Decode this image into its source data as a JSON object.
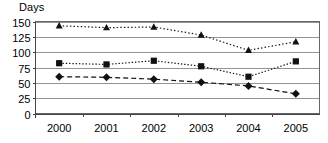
{
  "chart_data": {
    "type": "line",
    "title": "",
    "xlabel": "",
    "ylabel": "Days",
    "categories": [
      "2000",
      "2001",
      "2002",
      "2003",
      "2004",
      "2005"
    ],
    "ylim": [
      0,
      150
    ],
    "yticks": [
      0,
      25,
      50,
      75,
      100,
      125,
      150
    ],
    "ytick_labels": [
      "0",
      "25",
      "50",
      "75",
      "100",
      "125",
      "150"
    ],
    "grid": "horizontal",
    "legend": "none",
    "series": [
      {
        "name": "series-triangle",
        "marker": "triangle",
        "linestyle": "dotted",
        "color": "#111111",
        "values": [
          143,
          140,
          141,
          128,
          103,
          117
        ]
      },
      {
        "name": "series-square",
        "marker": "square",
        "linestyle": "fine-dotted",
        "color": "#111111",
        "values": [
          82,
          80,
          86,
          77,
          60,
          85
        ]
      },
      {
        "name": "series-diamond",
        "marker": "diamond",
        "linestyle": "dashed",
        "color": "#111111",
        "values": [
          60,
          59,
          56,
          51,
          45,
          32
        ]
      }
    ]
  }
}
